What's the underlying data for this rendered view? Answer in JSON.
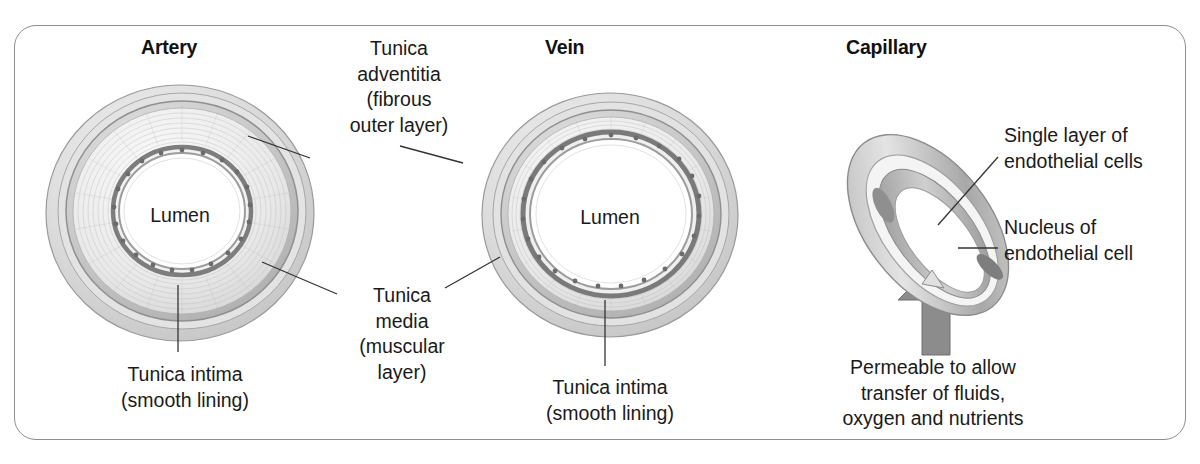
{
  "figure": {
    "title_panels": [
      "Artery",
      "Vein",
      "Capillary"
    ],
    "frame_color": "#8e8e8e",
    "background": "#ffffff"
  },
  "panels": {
    "artery": {
      "heading": "Artery",
      "lumen_label": "Lumen",
      "intima_label": "Tunica intima\n(smooth lining)"
    },
    "vein": {
      "heading": "Vein",
      "lumen_label": "Lumen",
      "intima_label": "Tunica intima\n(smooth lining)"
    },
    "capillary": {
      "heading": "Capillary",
      "single_layer_label": "Single layer of\nendothelial cells",
      "nucleus_label": "Nucleus of\nendothelial cell",
      "permeable_label": "Permeable to allow\ntransfer of fluids,\noxygen and nutrients"
    }
  },
  "shared_labels": {
    "adventitia": "Tunica\nadventitia\n(fibrous\nouter layer)",
    "media": "Tunica\nmedia\n(muscular\nlayer)"
  },
  "colors": {
    "outer_layer": "#d9d9d9",
    "media_layer": "#bfbfbf",
    "intima_ring": "#8a8a8a",
    "lumen": "#ffffff",
    "arrow": "#8c8c8c",
    "leader_line": "#333333",
    "text": "#1a1a1a"
  }
}
